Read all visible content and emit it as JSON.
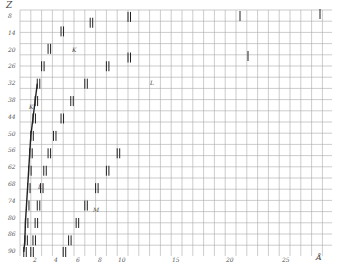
{
  "chart_data": {
    "type": "scatter",
    "title": "",
    "xlabel": "Å",
    "ylabel": "Z",
    "x_ticks": [
      "2",
      "4",
      "6",
      "8",
      "10",
      "15",
      "20",
      "25"
    ],
    "y_ticks": [
      "8",
      "14",
      "20",
      "26",
      "32",
      "38",
      "44",
      "50",
      "56",
      "62",
      "68",
      "74",
      "80",
      "86",
      "90"
    ],
    "grid": true,
    "series": [
      {
        "name": "K",
        "points": [
          [
            0.35,
            90
          ],
          [
            0.45,
            86
          ],
          [
            0.5,
            80
          ],
          [
            0.6,
            74
          ],
          [
            0.7,
            68
          ],
          [
            0.8,
            62
          ],
          [
            0.9,
            56
          ],
          [
            1.0,
            50
          ],
          [
            1.2,
            44
          ],
          [
            1.4,
            38
          ],
          [
            1.6,
            32
          ],
          [
            2.0,
            26
          ],
          [
            2.6,
            20
          ],
          [
            3.8,
            14
          ],
          [
            6.5,
            11
          ],
          [
            10,
            9
          ]
        ]
      },
      {
        "name": "L",
        "points": [
          [
            1.0,
            90
          ],
          [
            1.2,
            86
          ],
          [
            1.4,
            80
          ],
          [
            1.6,
            74
          ],
          [
            1.9,
            68
          ],
          [
            2.2,
            62
          ],
          [
            2.6,
            56
          ],
          [
            3.1,
            50
          ],
          [
            3.8,
            44
          ],
          [
            4.7,
            38
          ],
          [
            6,
            32
          ],
          [
            8,
            26
          ],
          [
            10,
            23
          ]
        ]
      },
      {
        "name": "M",
        "points": [
          [
            4,
            90
          ],
          [
            4.5,
            86
          ],
          [
            5.2,
            80
          ],
          [
            6,
            74
          ],
          [
            7,
            68
          ],
          [
            8,
            62
          ],
          [
            9,
            56
          ]
        ]
      }
    ],
    "annotations": [
      "K",
      "L",
      "M"
    ],
    "xlim": [
      0,
      28
    ],
    "ylim": [
      90,
      8
    ]
  },
  "labels": {
    "y_axis": "Z",
    "x_axis": "Å",
    "series_k": "K",
    "series_l": "L",
    "series_m": "M"
  }
}
